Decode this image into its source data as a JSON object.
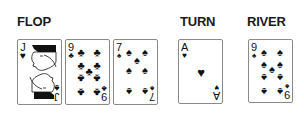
{
  "labels": {
    "flop": "FLOP",
    "turn": "TURN",
    "river": "RIVER"
  },
  "colors": {
    "ink": "#111111",
    "card_border": "#8a8a8a",
    "background": "#ffffff"
  },
  "flop": [
    {
      "rank": "J",
      "suit": "heart-icon",
      "suit_glyph": "♥",
      "bottom_suit_glyph": "♠",
      "face_card": true
    },
    {
      "rank": "9",
      "suit": "club-icon",
      "suit_glyph": "♣"
    },
    {
      "rank": "7",
      "suit": "spade-icon",
      "suit_glyph": "♠"
    }
  ],
  "turn": {
    "rank": "A",
    "suit": "heart-icon",
    "suit_glyph": "♥"
  },
  "river": {
    "rank": "9",
    "suit": "spade-icon",
    "suit_glyph": "♠"
  }
}
